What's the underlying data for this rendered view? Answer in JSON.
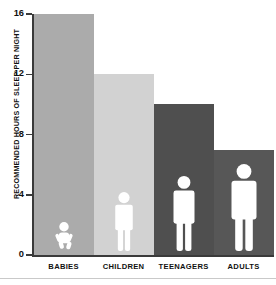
{
  "chart_data": {
    "type": "bar",
    "title": "",
    "subtitle": "",
    "xlabel": "",
    "ylabel": "RECOMMENDED HOURS OF SLEEP PER NIGHT",
    "categories": [
      "BABIES",
      "CHILDREN",
      "TEENAGERS",
      "ADULTS"
    ],
    "values": [
      16,
      12,
      10,
      7
    ],
    "ylim": [
      0,
      16
    ],
    "yticks": [
      0,
      4,
      8,
      12,
      16
    ],
    "ytick_labels": [
      "0",
      "4",
      "8",
      "12",
      "16"
    ],
    "grid": false,
    "legend": null,
    "bar_colors": [
      "#ababab",
      "#d2d2d2",
      "#4f4f4f",
      "#575757"
    ],
    "series": [
      {
        "name": "Recommended hours of sleep per night",
        "values": [
          16,
          12,
          10,
          7
        ]
      }
    ],
    "annotations": [
      {
        "category": "BABIES",
        "icon": "baby-figure-icon"
      },
      {
        "category": "CHILDREN",
        "icon": "child-figure-icon"
      },
      {
        "category": "TEENAGERS",
        "icon": "teenager-figure-icon"
      },
      {
        "category": "ADULTS",
        "icon": "adult-figure-icon"
      }
    ]
  },
  "colors": {
    "axis": "#3a3a3a",
    "text": "#111111",
    "background": "#ffffff",
    "figure": "#ffffff",
    "footer_rule": "#c9c9c9"
  }
}
